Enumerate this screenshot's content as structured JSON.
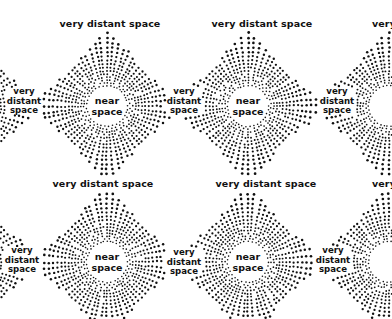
{
  "diagram": {
    "background": "#ffffff",
    "ink_color": "#111111",
    "near_space_label": [
      "near",
      "space"
    ],
    "very_distant_space_label": "very distant space",
    "very_distant_space_stacked": [
      "very",
      "distant",
      "space"
    ],
    "partial_label": "very",
    "near_space_centers": [
      {
        "id": "near-space-top-left",
        "x": 107,
        "y": 106
      },
      {
        "id": "near-space-top-right",
        "x": 248,
        "y": 106
      },
      {
        "id": "near-space-bottom-left",
        "x": 107,
        "y": 262
      },
      {
        "id": "near-space-bottom-right",
        "x": 248,
        "y": 262
      }
    ],
    "horizontal_labels": [
      {
        "id": "very-distant-space-top-1",
        "x": 110,
        "y": 24
      },
      {
        "id": "very-distant-space-top-2",
        "x": 262,
        "y": 24
      },
      {
        "id": "very-distant-space-mid-1",
        "x": 103,
        "y": 184
      },
      {
        "id": "very-distant-space-mid-2",
        "x": 266,
        "y": 184
      }
    ],
    "stacked_labels": [
      {
        "id": "very-distant-space-side-1",
        "x": 24,
        "y": 101
      },
      {
        "id": "very-distant-space-side-2",
        "x": 184,
        "y": 101
      },
      {
        "id": "very-distant-space-side-3",
        "x": 337,
        "y": 101
      },
      {
        "id": "very-distant-space-side-4",
        "x": 22,
        "y": 260
      },
      {
        "id": "very-distant-space-side-5",
        "x": 184,
        "y": 262
      },
      {
        "id": "very-distant-space-side-6",
        "x": 333,
        "y": 260
      }
    ],
    "partial_labels": [
      {
        "id": "very-partial-top",
        "x": 384,
        "y": 24
      },
      {
        "id": "very-partial-mid",
        "x": 384,
        "y": 184
      }
    ],
    "clear_radius": 19
  }
}
